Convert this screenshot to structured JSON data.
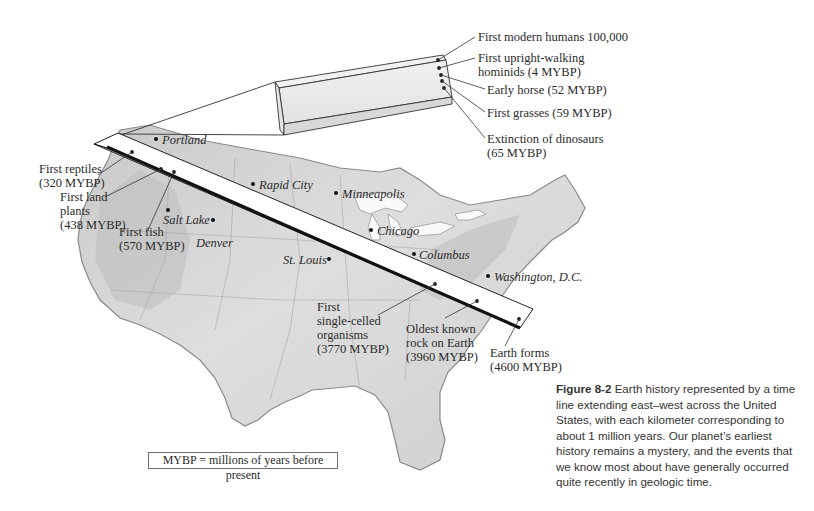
{
  "figure": {
    "number_label": "Figure 8-2",
    "caption_text": "Earth history represented by a time line extending east–west across the United States, with each kilometer corresponding to about 1 million years. Our planet’s earliest history remains a mystery, and the events that we know most about have generally occurred quite recently in geologic time."
  },
  "legend": {
    "text": "MYBP = millions of years before present"
  },
  "cities": [
    {
      "name": "Portland"
    },
    {
      "name": "Rapid City"
    },
    {
      "name": "Minneapolis"
    },
    {
      "name": "Salt Lake"
    },
    {
      "name": "Denver"
    },
    {
      "name": "Chicago"
    },
    {
      "name": "Columbus"
    },
    {
      "name": "St. Louis"
    },
    {
      "name": "Washington, D.C."
    }
  ],
  "timeline_events": {
    "inset": [
      {
        "line1": "First modern humans 100,000",
        "line2": ""
      },
      {
        "line1": "First upright-walking",
        "line2": "hominids (4 MYBP)"
      },
      {
        "line1": "Early horse (52 MYBP)",
        "line2": ""
      },
      {
        "line1": "First grasses (59 MYBP)",
        "line2": ""
      },
      {
        "line1": "Extinction of dinosaurs",
        "line2": "(65 MYBP)"
      }
    ],
    "west": [
      {
        "line1": "First reptiles",
        "line2": "(320 MYBP)"
      },
      {
        "line1": "First land",
        "line2": "plants",
        "line3": "(438 MYBP)"
      },
      {
        "line1": "First fish",
        "line2": "(570 MYBP)"
      }
    ],
    "east": [
      {
        "line1": "First",
        "line2": "single-celled",
        "line3": "organisms",
        "line4": "(3770 MYBP)"
      },
      {
        "line1": "Oldest known",
        "line2": "rock on Earth",
        "line3": "(3960 MYBP)"
      },
      {
        "line1": "Earth forms",
        "line2": "(4600 MYBP)"
      }
    ]
  },
  "colors": {
    "map_fill": "#d9d9d9",
    "map_shade": "#bdbdbd",
    "map_outline": "#8a8a8a",
    "timeline_face": "#ffffff",
    "timeline_edge": "#1a1a1a",
    "text": "#2b2b2b"
  }
}
